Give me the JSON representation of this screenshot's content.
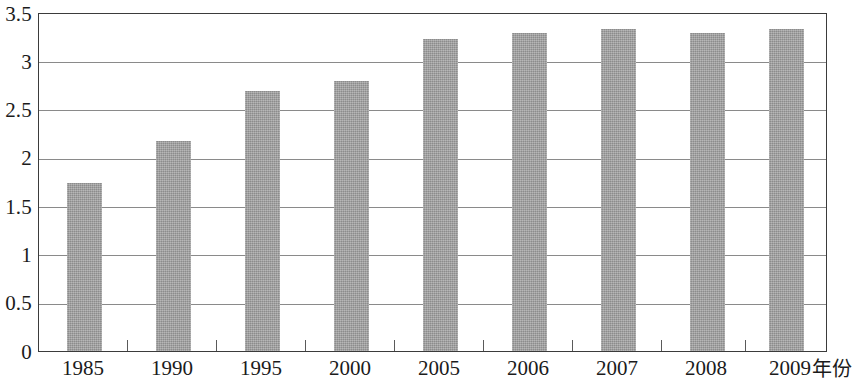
{
  "chart_data": {
    "type": "bar",
    "title": "",
    "subtitle": "",
    "xlabel": "年份",
    "ylabel": "",
    "categories": [
      "1985",
      "1990",
      "1995",
      "2000",
      "2005",
      "2006",
      "2007",
      "2008",
      "2009"
    ],
    "values": [
      1.75,
      2.18,
      2.7,
      2.8,
      3.24,
      3.3,
      3.34,
      3.3,
      3.34
    ],
    "series": [
      {
        "name": "",
        "values": [
          1.75,
          2.18,
          2.7,
          2.8,
          3.24,
          3.3,
          3.34,
          3.3,
          3.34
        ]
      }
    ],
    "ylim": [
      0,
      3.5
    ],
    "yticks": [
      0,
      0.5,
      1,
      1.5,
      2,
      2.5,
      3,
      3.5
    ],
    "ytick_labels": [
      "0",
      "0.5",
      "1",
      "1.5",
      "2",
      "2.5",
      "3",
      "3.5"
    ],
    "grid": true,
    "grid_axis": "y",
    "legend": false,
    "legend_position": "none",
    "bar_color": "#9b9b9b",
    "axis_color": "#3b3b3b",
    "gridline_color": "#8a8a8a",
    "text_color": "#1b1b1b",
    "annotations": []
  }
}
